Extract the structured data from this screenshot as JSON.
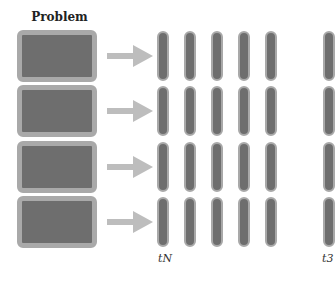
{
  "diagram": {
    "title": "Problem",
    "rows": 4,
    "blocks": [
      {
        "top": 30
      },
      {
        "top": 85
      },
      {
        "top": 141
      },
      {
        "top": 196
      }
    ],
    "bar_columns": [
      157,
      184,
      211,
      238,
      265,
      323
    ],
    "labels": [
      {
        "text": "tN",
        "left": 158,
        "top": 254
      },
      {
        "text": "t3",
        "left": 322,
        "top": 254
      }
    ],
    "colors": {
      "fill": "#6e6e6e",
      "border": "#a9a9a9",
      "arrow": "#bdbdbd"
    }
  }
}
